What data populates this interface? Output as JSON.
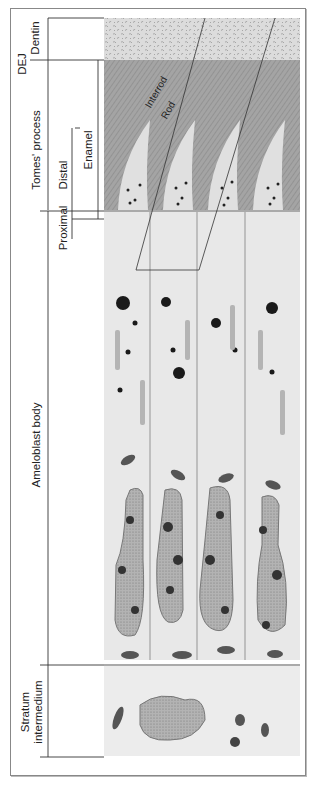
{
  "figure": {
    "labels": {
      "dentin": "Dentin",
      "dej": "DEJ",
      "tomes_process": "Tomes' process",
      "enamel": "Enamel",
      "distal": "Distal",
      "proximal": "Proximal",
      "ameloblast_body": "Ameloblast body",
      "stratum_line1": "Stratum",
      "stratum_line2": "intermedium",
      "interrod": "Interrod",
      "rod": "Rod"
    },
    "colors": {
      "dentin": "#d9d9d9",
      "enamel": "#9c9c9c",
      "cytoplasm": "#e6e6e6",
      "nucleus": "#a8a8a8",
      "mitochondria": "#555555",
      "granule": "#222222",
      "line": "#333333"
    }
  }
}
